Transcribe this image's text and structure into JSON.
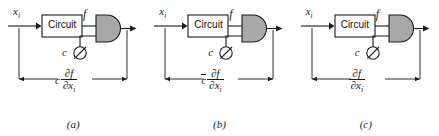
{
  "figure": {
    "background_color": "#ffffff",
    "line_color": "#1a1a1a",
    "gate_fill_color": "#a8a8a8",
    "box_fill_color": "#ffffff"
  },
  "panels": [
    {
      "caption": "(a)",
      "input_label": "x",
      "input_subscript": "i",
      "block_label": "Circuit",
      "block_output_label": "f",
      "control_label": "c",
      "control_symbol": "circle-with-slash",
      "gate_symbol": "and-gate",
      "dimension": {
        "coefficient": "c",
        "coefficient_overbar": false,
        "numerator": "∂f",
        "denominator": "∂x",
        "denominator_subscript": "i"
      }
    },
    {
      "caption": "(b)",
      "input_label": "x",
      "input_subscript": "i",
      "block_label": "Circuit",
      "block_output_label": "f",
      "control_label": "c",
      "control_symbol": "circle-with-slash",
      "gate_symbol": "and-gate",
      "dimension": {
        "coefficient": "c",
        "coefficient_overbar": true,
        "numerator": "∂f",
        "denominator": "∂x",
        "denominator_subscript": "i"
      }
    },
    {
      "caption": "(c)",
      "input_label": "x",
      "input_subscript": "i",
      "block_label": "Circuit",
      "block_output_label": "f",
      "control_label": "c",
      "control_symbol": "circle-with-slash",
      "gate_symbol": "and-gate",
      "dimension": {
        "coefficient": "",
        "coefficient_overbar": false,
        "numerator": "∂f",
        "denominator": "∂x",
        "denominator_subscript": "i"
      }
    }
  ]
}
